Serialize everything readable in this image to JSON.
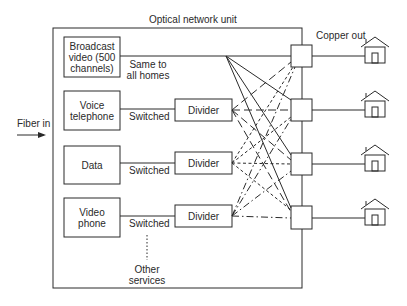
{
  "diagram": {
    "title": "Optical network unit",
    "input_label": "Fiber in",
    "output_label": "Copper out",
    "sources": [
      {
        "label": "Broadcast\nvideo (500\nchannels)",
        "link_label": "Same to\nall homes"
      },
      {
        "label": "Voice\ntelephone",
        "link_label": "Switched",
        "via": "Divider"
      },
      {
        "label": "Data",
        "link_label": "Switched",
        "via": "Divider"
      },
      {
        "label": "Video\nphone",
        "link_label": "Switched",
        "via": "Divider"
      }
    ],
    "other_services_label": "Other\nservices",
    "homes_count": 4,
    "line_styles": {
      "broadcast": "solid",
      "voice": "long-dash",
      "data": "short-dash",
      "video_phone": "dash-dot"
    },
    "colors": {
      "stroke": "#2a2a2a",
      "background": "#ffffff"
    }
  }
}
